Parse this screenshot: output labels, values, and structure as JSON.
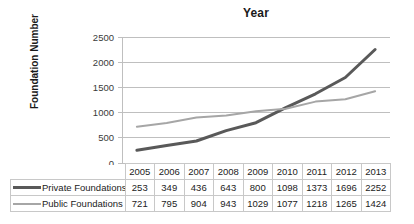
{
  "chart_data": {
    "type": "line",
    "title": "Year",
    "xlabel": "",
    "ylabel": "Foundation Number",
    "categories": [
      "2005",
      "2006",
      "2007",
      "2008",
      "2009",
      "2010",
      "2011",
      "2012",
      "2013"
    ],
    "ylim": [
      0,
      2500
    ],
    "yticks": [
      0,
      500,
      1000,
      1500,
      2000,
      2500
    ],
    "ytick_labels": [
      "0",
      "500",
      "1000",
      "1500",
      "2000",
      "2500"
    ],
    "grid": true,
    "legend_position": "table-below",
    "series": [
      {
        "name": "Private Foundations",
        "color": "#595959",
        "width": 3,
        "values": [
          253,
          349,
          436,
          643,
          800,
          1098,
          1373,
          1696,
          2252
        ]
      },
      {
        "name": "Public Foundations",
        "color": "#a6a6a6",
        "width": 2,
        "values": [
          721,
          795,
          904,
          943,
          1029,
          1077,
          1218,
          1265,
          1424
        ]
      }
    ]
  },
  "colors": {
    "grid": "#bfbfbf",
    "axis": "#bfbfbf",
    "table_border": "#c8c8c8",
    "text": "#222222"
  }
}
